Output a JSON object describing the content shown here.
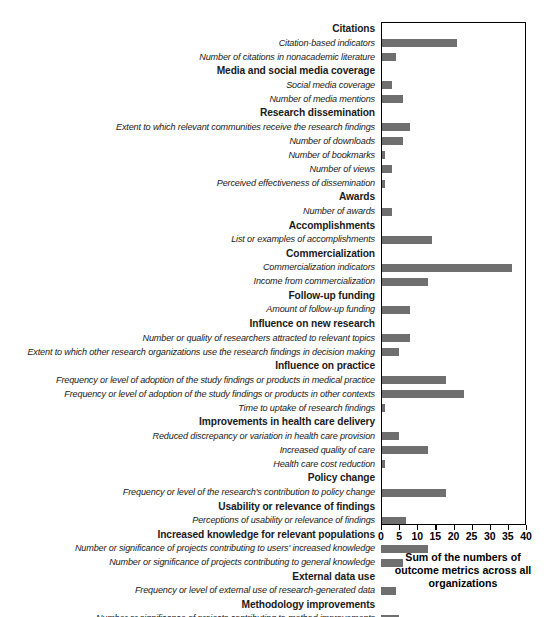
{
  "chart_data": {
    "type": "bar",
    "orientation": "horizontal",
    "title": "",
    "xlabel": "Sum of the numbers of outcome metrics across all organizations",
    "ylabel": "",
    "xlim": [
      0,
      40
    ],
    "xticks": [
      0,
      5,
      10,
      15,
      20,
      25,
      30,
      35,
      40
    ],
    "grid": false,
    "legend": null,
    "bar_color": "#6f6f6f",
    "axis_color": "#000000",
    "rows": [
      {
        "kind": "group",
        "label": "Citations",
        "value": null
      },
      {
        "kind": "metric",
        "label": "Citation-based indicators",
        "value": 21
      },
      {
        "kind": "metric",
        "label": "Number of citations in nonacademic literature",
        "value": 4
      },
      {
        "kind": "group",
        "label": "Media and social media coverage",
        "value": null
      },
      {
        "kind": "metric",
        "label": "Social media coverage",
        "value": 3
      },
      {
        "kind": "metric",
        "label": "Number of media mentions",
        "value": 6
      },
      {
        "kind": "group",
        "label": "Research dissemination",
        "value": null
      },
      {
        "kind": "metric",
        "label": "Extent to which relevant communities receive the research findings",
        "value": 8
      },
      {
        "kind": "metric",
        "label": "Number of downloads",
        "value": 6
      },
      {
        "kind": "metric",
        "label": "Number of bookmarks",
        "value": 1
      },
      {
        "kind": "metric",
        "label": "Number of views",
        "value": 3
      },
      {
        "kind": "metric",
        "label": "Perceived effectiveness of dissemination",
        "value": 1
      },
      {
        "kind": "group",
        "label": "Awards",
        "value": null
      },
      {
        "kind": "metric",
        "label": "Number of awards",
        "value": 3
      },
      {
        "kind": "group",
        "label": "Accomplishments",
        "value": null
      },
      {
        "kind": "metric",
        "label": "List or examples of accomplishments",
        "value": 14
      },
      {
        "kind": "group",
        "label": "Commercialization",
        "value": null
      },
      {
        "kind": "metric",
        "label": "Commercialization indicators",
        "value": 36
      },
      {
        "kind": "metric",
        "label": "Income from commercialization",
        "value": 13
      },
      {
        "kind": "group",
        "label": "Follow-up funding",
        "value": null
      },
      {
        "kind": "metric",
        "label": "Amount of follow-up funding",
        "value": 8
      },
      {
        "kind": "group",
        "label": "Influence on new research",
        "value": null
      },
      {
        "kind": "metric",
        "label": "Number or quality of researchers attracted to relevant topics",
        "value": 8
      },
      {
        "kind": "metric",
        "label": "Extent to which other research organizations use the research findings in decision making",
        "value": 5
      },
      {
        "kind": "group",
        "label": "Influence on practice",
        "value": null
      },
      {
        "kind": "metric",
        "label": "Frequency or level of adoption of the study findings or products in medical practice",
        "value": 18
      },
      {
        "kind": "metric",
        "label": "Frequency or level of adoption of the study findings or products in other contexts",
        "value": 23
      },
      {
        "kind": "metric",
        "label": "Time to uptake of research findings",
        "value": 1
      },
      {
        "kind": "group",
        "label": "Improvements in health care delivery",
        "value": null
      },
      {
        "kind": "metric",
        "label": "Reduced discrepancy or variation in health care provision",
        "value": 5
      },
      {
        "kind": "metric",
        "label": "Increased quality of care",
        "value": 13
      },
      {
        "kind": "metric",
        "label": "Health care cost reduction",
        "value": 1
      },
      {
        "kind": "group",
        "label": "Policy change",
        "value": null
      },
      {
        "kind": "metric",
        "label": "Frequency or level of the research's contribution to policy change",
        "value": 18
      },
      {
        "kind": "group",
        "label": "Usability or relevance of findings",
        "value": null
      },
      {
        "kind": "metric",
        "label": "Perceptions of usability or relevance of findings",
        "value": 7
      },
      {
        "kind": "group",
        "label": "Increased knowledge for relevant populations",
        "value": null
      },
      {
        "kind": "metric",
        "label": "Number or significance of projects contributing to users' increased knowledge",
        "value": 13
      },
      {
        "kind": "metric",
        "label": "Number or significance of projects contributing to general knowledge",
        "value": 6
      },
      {
        "kind": "group",
        "label": "External data use",
        "value": null
      },
      {
        "kind": "metric",
        "label": "Frequency or level of external use of research-generated data",
        "value": 4
      },
      {
        "kind": "group",
        "label": "Methodology improvements",
        "value": null
      },
      {
        "kind": "metric",
        "label": "Number or significance of projects contributing to method improvements",
        "value": 5
      }
    ]
  },
  "axis": {
    "title_line1": "Sum of the numbers of",
    "title_line2": "outcome metrics across all",
    "title_line3": "organizations"
  }
}
